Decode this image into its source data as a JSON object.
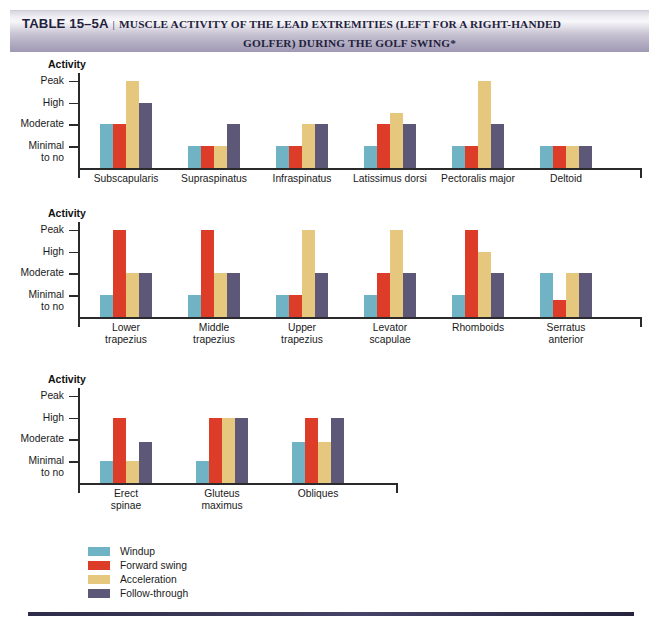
{
  "title": {
    "label": "TABLE 15–5A",
    "separator": "|",
    "line1": "MUSCLE ACTIVITY OF THE LEAD EXTREMITIES (LEFT FOR A RIGHT-HANDED",
    "line2": "GOLFER) DURING THE GOLF SWING*"
  },
  "axis_title": "Activity",
  "y_tick_labels": [
    "Peak",
    "High",
    "Moderate",
    "Minimal",
    "to no"
  ],
  "legend": [
    {
      "label": "Windup",
      "color": "#6fb3c4"
    },
    {
      "label": "Forward swing",
      "color": "#dc3c28"
    },
    {
      "label": "Acceleration",
      "color": "#e5c87e"
    },
    {
      "label": "Follow-through",
      "color": "#5d5878"
    }
  ],
  "colors": {
    "windup": "#6fb3c4",
    "forward_swing": "#dc3c28",
    "acceleration": "#e5c87e",
    "follow_through": "#5d5878",
    "banner_start": "#efeef3",
    "banner_end": "#9f99b3",
    "title_text": "#241f3d",
    "footer_rule": "#32304f"
  },
  "chart_data": [
    {
      "type": "bar",
      "title": "Activity",
      "xlabel": "",
      "ylabel": "Activity",
      "ylim": [
        0,
        4.4
      ],
      "grid": false,
      "legend_position": "bottom-left",
      "ytick_values": [
        1,
        2,
        3,
        4
      ],
      "ytick_labels": [
        "Minimal to no",
        "Moderate",
        "High",
        "Peak"
      ],
      "categories": [
        "Subscapularis",
        "Supraspinatus",
        "Infraspinatus",
        "Latissimus dorsi",
        "Pectoralis major",
        "Deltoid"
      ],
      "series": [
        {
          "name": "Windup",
          "values": [
            2,
            1,
            1,
            1,
            1,
            1
          ]
        },
        {
          "name": "Forward swing",
          "values": [
            2,
            1,
            1,
            2,
            1,
            1
          ]
        },
        {
          "name": "Acceleration",
          "values": [
            4,
            1,
            2,
            2.5,
            4,
            1
          ]
        },
        {
          "name": "Follow-through",
          "values": [
            3,
            2,
            2,
            2,
            2,
            1
          ]
        }
      ]
    },
    {
      "type": "bar",
      "title": "Activity",
      "xlabel": "",
      "ylabel": "Activity",
      "ylim": [
        0,
        4.4
      ],
      "grid": false,
      "legend_position": "bottom-left",
      "ytick_values": [
        1,
        2,
        3,
        4
      ],
      "ytick_labels": [
        "Minimal to no",
        "Moderate",
        "High",
        "Peak"
      ],
      "categories": [
        "Lower trapezius",
        "Middle trapezius",
        "Upper trapezius",
        "Levator scapulae",
        "Rhomboids",
        "Serratus anterior"
      ],
      "series": [
        {
          "name": "Windup",
          "values": [
            1,
            1,
            1,
            1,
            1,
            2
          ]
        },
        {
          "name": "Forward swing",
          "values": [
            4,
            4,
            1,
            2,
            4,
            0.8
          ]
        },
        {
          "name": "Acceleration",
          "values": [
            2,
            2,
            4,
            4,
            3,
            2
          ]
        },
        {
          "name": "Follow-through",
          "values": [
            2,
            2,
            2,
            2,
            2,
            2
          ]
        }
      ]
    },
    {
      "type": "bar",
      "title": "Activity",
      "xlabel": "",
      "ylabel": "Activity",
      "ylim": [
        0,
        4.4
      ],
      "grid": false,
      "legend_position": "bottom-left",
      "ytick_values": [
        1,
        2,
        3,
        4
      ],
      "ytick_labels": [
        "Minimal to no",
        "Moderate",
        "High",
        "Peak"
      ],
      "categories": [
        "Erect spinae",
        "Gluteus maximus",
        "Obliques"
      ],
      "series": [
        {
          "name": "Windup",
          "values": [
            1,
            1,
            1.9
          ]
        },
        {
          "name": "Forward swing",
          "values": [
            3,
            3,
            3
          ]
        },
        {
          "name": "Acceleration",
          "values": [
            1,
            3,
            1.9
          ]
        },
        {
          "name": "Follow-through",
          "values": [
            1.9,
            3,
            3
          ]
        }
      ]
    }
  ],
  "category_label_lines": [
    [
      [
        "Subscapularis"
      ],
      [
        "Supraspinatus"
      ],
      [
        "Infraspinatus"
      ],
      [
        "Latissimus dorsi"
      ],
      [
        "Pectoralis major"
      ],
      [
        "Deltoid"
      ]
    ],
    [
      [
        "Lower",
        "trapezius"
      ],
      [
        "Middle",
        "trapezius"
      ],
      [
        "Upper",
        "trapezius"
      ],
      [
        "Levator",
        "scapulae"
      ],
      [
        "Rhomboids"
      ],
      [
        "Serratus",
        "anterior"
      ]
    ],
    [
      [
        "Erect",
        "spinae"
      ],
      [
        "Gluteus",
        "maximus"
      ],
      [
        "Obliques"
      ]
    ]
  ]
}
